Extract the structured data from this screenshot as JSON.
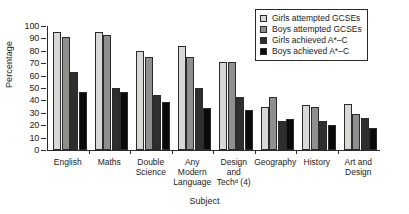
{
  "chart_data": {
    "type": "bar",
    "title": "",
    "xlabel": "Subject",
    "ylabel": "Percentage",
    "ylim": [
      0,
      100
    ],
    "yticks": [
      0,
      10,
      20,
      30,
      40,
      50,
      60,
      70,
      80,
      90,
      100
    ],
    "grid": false,
    "legend_position": "top-right",
    "categories": [
      "English",
      "Maths",
      "Double\nScience",
      "Any\nModern\nLanguage",
      "Design\nand\nTechᵈ (4)",
      "Geography",
      "History",
      "Art and\nDesign"
    ],
    "series": [
      {
        "name": "Girls attempted GCSEs",
        "color": "#d8d8d6",
        "values": [
          95,
          95,
          80,
          84,
          71,
          35,
          36,
          37
        ]
      },
      {
        "name": "Boys attempted GCSEs",
        "color": "#8f8f8d",
        "values": [
          91,
          93,
          75,
          75,
          71,
          43,
          35,
          29
        ]
      },
      {
        "name": "Girls achieved A*–C",
        "color": "#2e2e2e",
        "values": [
          63,
          50,
          44,
          50,
          43,
          23,
          23,
          26
        ]
      },
      {
        "name": "Boys achieved A*–C",
        "color": "#0a0a0a",
        "values": [
          47,
          47,
          39,
          34,
          32,
          25,
          20,
          18
        ]
      }
    ]
  },
  "legend": {
    "items": [
      "Girls attempted GCSEs",
      "Boys attempted GCSEs",
      "Girls achieved A*–C",
      "Boys achieved A*–C"
    ]
  }
}
